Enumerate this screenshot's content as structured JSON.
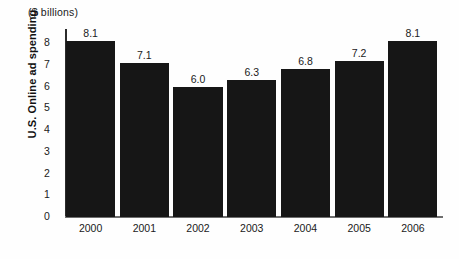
{
  "chart_data": {
    "type": "bar",
    "title": "",
    "subtitle": "",
    "units_caption": "($ billions)",
    "xlabel": "",
    "ylabel": "U.S. Online ad spending",
    "categories": [
      "2000",
      "2001",
      "2002",
      "2003",
      "2004",
      "2005",
      "2006"
    ],
    "values": [
      8.1,
      7.1,
      6.0,
      6.3,
      6.8,
      7.2,
      8.1
    ],
    "value_labels": [
      "8.1",
      "7.1",
      "6.0",
      "6.3",
      "6.8",
      "7.2",
      "8.1"
    ],
    "ylim": [
      0,
      8.7
    ],
    "yticks": [
      0,
      1,
      2,
      3,
      4,
      5,
      6,
      7,
      8
    ],
    "ytick_labels": [
      "0",
      "1",
      "2",
      "3",
      "4",
      "5",
      "6",
      "7",
      "8"
    ],
    "grid": false,
    "legend": null,
    "legend_position": "none",
    "bar_color": "#161616",
    "axis_color": "#2b2b2b",
    "baseline_color": "#6e6e6e",
    "text_color": "#1a1a1a",
    "background_color": "#fefefe"
  }
}
